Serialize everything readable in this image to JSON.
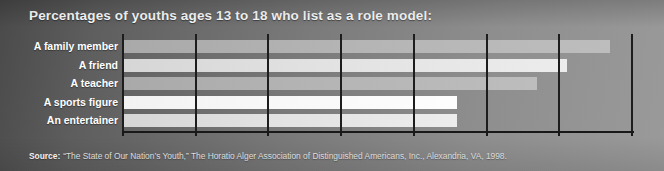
{
  "chart_data": {
    "type": "bar",
    "orientation": "horizontal",
    "title": "Percentages of youths ages 13 to 18 who list as a role model:",
    "categories": [
      "A family member",
      "A friend",
      "A teacher",
      "A sports figure",
      "An entertainer"
    ],
    "values": [
      67,
      61,
      57,
      46,
      46
    ],
    "xlabel": "",
    "ylabel": "",
    "xlim": [
      0,
      70
    ],
    "xtick_labels": [
      "0%",
      "10%",
      "20%",
      "30%",
      "40%",
      "50%",
      "60%",
      "70%"
    ],
    "xtick_values": [
      0,
      10,
      20,
      30,
      40,
      50,
      60,
      70
    ],
    "grid": "vertical",
    "legend": "none",
    "bar_shades": [
      "shade-a",
      "shade-b",
      "shade-a",
      "shade-c",
      "shade-b"
    ]
  },
  "source": {
    "label": "Source:",
    "text": "“The State of Our Nation’s Youth,” The Horatio Alger Association of Distinguished Americans, Inc., Alexandria, VA, 1998."
  },
  "colors": {
    "title_text": "#ffffff",
    "label_text": "#ffffff",
    "axis": "#181818",
    "gridline": "#1d1d1d",
    "background_dark": "#4a4a4a",
    "background_light": "#9a9a9a"
  }
}
